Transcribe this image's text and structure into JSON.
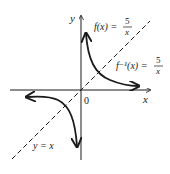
{
  "diagram": {
    "axes": {
      "x_label": "x",
      "y_label": "y",
      "origin_label": "0"
    },
    "curves": [
      {
        "name": "f",
        "label_lhs": "f(x) =",
        "label_num": "5",
        "label_den": "x"
      },
      {
        "name": "f_inverse",
        "label_lhs": "f⁻¹(x) =",
        "label_num": "5",
        "label_den": "x"
      }
    ],
    "line": {
      "label": "y = x",
      "style": "dashed"
    },
    "colors": {
      "ink": "#1a1a1a",
      "background": "#ffffff"
    }
  }
}
